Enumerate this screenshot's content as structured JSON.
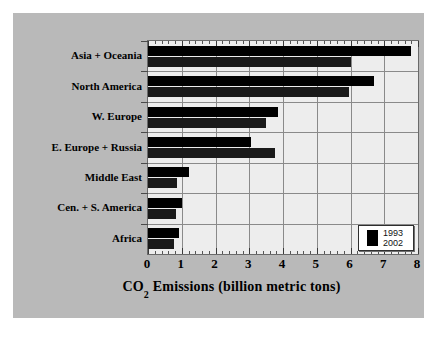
{
  "figure": {
    "background_color": "#b9b9b9",
    "page_color": "#ffffff",
    "plot_background_color": "#ededed"
  },
  "axis_title": {
    "prefix": "CO",
    "subscript": "2",
    "suffix": " Emissions (billion metric tons)",
    "full": "CO2 Emissions (billion metric tons)"
  },
  "legend": {
    "years": [
      "1993",
      "2002"
    ],
    "swatch_color": "#000000"
  },
  "chart_data": {
    "type": "bar",
    "orientation": "horizontal",
    "title": "",
    "subtitle": "",
    "xlabel": "CO2 Emissions (billion metric tons)",
    "ylabel": "",
    "xlim": [
      0,
      8
    ],
    "xticks": [
      0,
      1,
      2,
      3,
      4,
      5,
      6,
      7,
      8
    ],
    "xtick_labels": [
      "0",
      "1",
      "2",
      "3",
      "4",
      "5",
      "6",
      "7",
      "8"
    ],
    "minor_ticks_per_interval": 5,
    "grid": true,
    "grid_axis": "x",
    "legend_position": "lower right",
    "categories": [
      "Asia + Oceania",
      "North America",
      "W. Europe",
      "E. Europe + Russia",
      "Middle East",
      "Cen. + S. America",
      "Africa"
    ],
    "series": [
      {
        "name": "2002",
        "color": "#000000",
        "position_in_group": "upper",
        "values": [
          7.8,
          6.7,
          3.85,
          3.05,
          1.2,
          1.0,
          0.92
        ]
      },
      {
        "name": "1993",
        "color": "#1a1a1a",
        "position_in_group": "lower",
        "values": [
          6.0,
          5.95,
          3.5,
          3.75,
          0.85,
          0.82,
          0.78
        ]
      }
    ],
    "units": "billion metric tons"
  }
}
